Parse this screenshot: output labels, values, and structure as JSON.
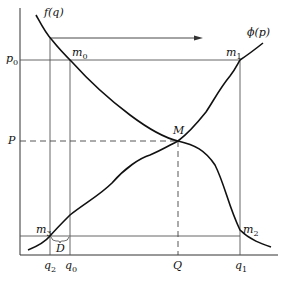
{
  "diagram": {
    "curves": {
      "demand": {
        "label": "f(q)"
      },
      "supply": {
        "label": "ϕ(p)"
      }
    },
    "points": {
      "m0": {
        "label": "m",
        "sub": "0"
      },
      "m1": {
        "label": "m",
        "sub": "1"
      },
      "m2": {
        "label": "m",
        "sub": "2"
      },
      "m3": {
        "label": "m",
        "sub": "3"
      },
      "M": {
        "label": "M"
      },
      "D": {
        "label": "D"
      }
    },
    "y_axis_labels": {
      "p0": {
        "label": "p",
        "sub": "0"
      },
      "P": {
        "label": "P"
      }
    },
    "x_axis_labels": {
      "q2": {
        "label": "q",
        "sub": "2"
      },
      "q0": {
        "label": "q",
        "sub": "0"
      },
      "Q": {
        "label": "Q"
      },
      "q1": {
        "label": "q",
        "sub": "1"
      }
    },
    "colors": {
      "line": "#111111",
      "grid": "#555555",
      "background": "#ffffff"
    }
  }
}
